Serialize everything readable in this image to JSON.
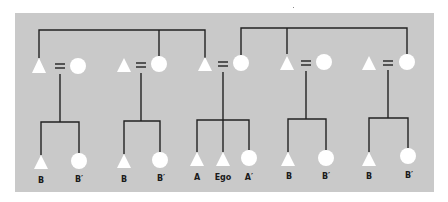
{
  "diagram": {
    "type": "kinship-chart",
    "colors": {
      "page_background": "#ffffff",
      "panel_background": "#c9c9c9",
      "line": "#222222",
      "symbol_fill": "#ffffff"
    },
    "legend": {
      "triangle": "male",
      "circle": "female",
      "equals": "marriage"
    },
    "parent_couples": [
      {
        "id": 1,
        "husband": "triangle",
        "wife": "circle"
      },
      {
        "id": 2,
        "husband": "triangle",
        "wife": "circle"
      },
      {
        "id": 3,
        "husband": "triangle",
        "wife": "circle"
      },
      {
        "id": 4,
        "husband": "triangle",
        "wife": "circle"
      },
      {
        "id": 5,
        "husband": "triangle",
        "wife": "circle"
      },
      {
        "id": 6,
        "husband": "triangle",
        "wife": "circle"
      }
    ],
    "sibling_links_top": [
      {
        "members": [
          "couple1.husband",
          "couple2.wife",
          "couple3.husband"
        ]
      },
      {
        "members": [
          "couple3.wife",
          "couple4.husband",
          "couple5.wife"
        ]
      }
    ],
    "children": {
      "group1": [
        {
          "symbol": "triangle",
          "label": "B"
        },
        {
          "symbol": "circle",
          "label": "B′"
        }
      ],
      "group2": [
        {
          "symbol": "triangle",
          "label": "B"
        },
        {
          "symbol": "circle",
          "label": "B′"
        }
      ],
      "group3": [
        {
          "symbol": "triangle",
          "label": "A"
        },
        {
          "symbol": "triangle",
          "label": "Ego"
        },
        {
          "symbol": "circle",
          "label": "A′"
        }
      ],
      "group4": [
        {
          "symbol": "triangle",
          "label": "B"
        },
        {
          "symbol": "circle",
          "label": "B′"
        }
      ],
      "group5": [
        {
          "symbol": "triangle",
          "label": "B"
        },
        {
          "symbol": "circle",
          "label": "B′"
        }
      ]
    }
  }
}
